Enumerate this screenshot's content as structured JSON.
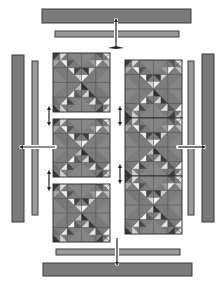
{
  "diagram": {
    "colors": {
      "background": "#ffffff",
      "outer_border": "#7a7a7a",
      "inner_border": "#9a9a9a",
      "block_base": "#8a8a8a",
      "dark": "#3c3c3c",
      "medium": "#6f6f6f",
      "light": "#d6d6d6",
      "white": "#f2f2f2",
      "outline": "#333333"
    },
    "borders": {
      "top_outer": {
        "x": 42,
        "y": 9,
        "w": 149,
        "h": 14
      },
      "top_inner": {
        "x": 55,
        "y": 31,
        "w": 124,
        "h": 6
      },
      "bottom_inner": {
        "x": 56,
        "y": 249,
        "w": 124,
        "h": 6
      },
      "bottom_outer": {
        "x": 43,
        "y": 263,
        "w": 149,
        "h": 13
      },
      "left_outer": {
        "x": 12,
        "y": 55,
        "w": 12,
        "h": 167
      },
      "left_inner": {
        "x": 32,
        "y": 61,
        "w": 6,
        "h": 154
      },
      "right_inner": {
        "x": 188,
        "y": 61,
        "w": 6,
        "h": 154
      },
      "right_outer": {
        "x": 202,
        "y": 54,
        "w": 12,
        "h": 168
      }
    },
    "left_column": {
      "blocks": [
        {
          "x": 53,
          "y": 53,
          "w": 57,
          "h": 59
        },
        {
          "x": 53,
          "y": 119,
          "w": 57,
          "h": 58
        },
        {
          "x": 53,
          "y": 184,
          "w": 57,
          "h": 58
        }
      ]
    },
    "right_column": {
      "x": 125,
      "y": 60,
      "w": 57,
      "h": 174,
      "blocks": 3
    },
    "arrows": [
      {
        "name": "top-border-arrow",
        "x1": 116,
        "y1": 22,
        "x2": 116,
        "y2": 48,
        "cap": "down-spread"
      },
      {
        "name": "bottom-border-arrow",
        "x1": 117,
        "y1": 240,
        "x2": 117,
        "y2": 264,
        "cap": "down"
      },
      {
        "name": "left-border-arrow",
        "x1": 23,
        "y1": 147,
        "x2": 55,
        "y2": 147,
        "cap": "left"
      },
      {
        "name": "right-border-arrow",
        "x1": 178,
        "y1": 147,
        "x2": 204,
        "y2": 147,
        "cap": "right"
      },
      {
        "name": "left-join-arrow-1",
        "x1": 49,
        "y1": 110,
        "x2": 49,
        "y2": 122,
        "cap": "both"
      },
      {
        "name": "left-join-arrow-2",
        "x1": 49,
        "y1": 175,
        "x2": 49,
        "y2": 187,
        "cap": "both"
      },
      {
        "name": "right-join-arrow-1",
        "x1": 120,
        "y1": 110,
        "x2": 120,
        "y2": 122,
        "cap": "both"
      },
      {
        "name": "right-join-arrow-2",
        "x1": 120,
        "y1": 168,
        "x2": 120,
        "y2": 180,
        "cap": "both"
      }
    ]
  }
}
